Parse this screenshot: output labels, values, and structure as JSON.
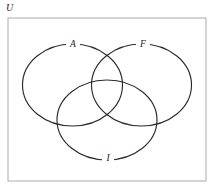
{
  "diagram": {
    "type": "venn-diagram-3-set",
    "universe_label": "U",
    "background_color": "#ffffff",
    "border_color": "#b9b9b9",
    "stroke_color": "#2b2b2b",
    "universe": {
      "x": 8,
      "y": 18,
      "width": 198,
      "height": 163
    },
    "sets": [
      {
        "id": "set-a",
        "label": "A",
        "cx": 72.5,
        "cy": 85,
        "rx": 50,
        "ry": 41,
        "label_x": 73,
        "label_y": 44.5
      },
      {
        "id": "set-f",
        "label": "F",
        "cx": 141.5,
        "cy": 85,
        "rx": 50,
        "ry": 41,
        "label_x": 143,
        "label_y": 45
      },
      {
        "id": "set-i",
        "label": "I",
        "cx": 107,
        "cy": 120,
        "rx": 50,
        "ry": 40,
        "label_x": 108,
        "label_y": 158.5
      }
    ]
  }
}
